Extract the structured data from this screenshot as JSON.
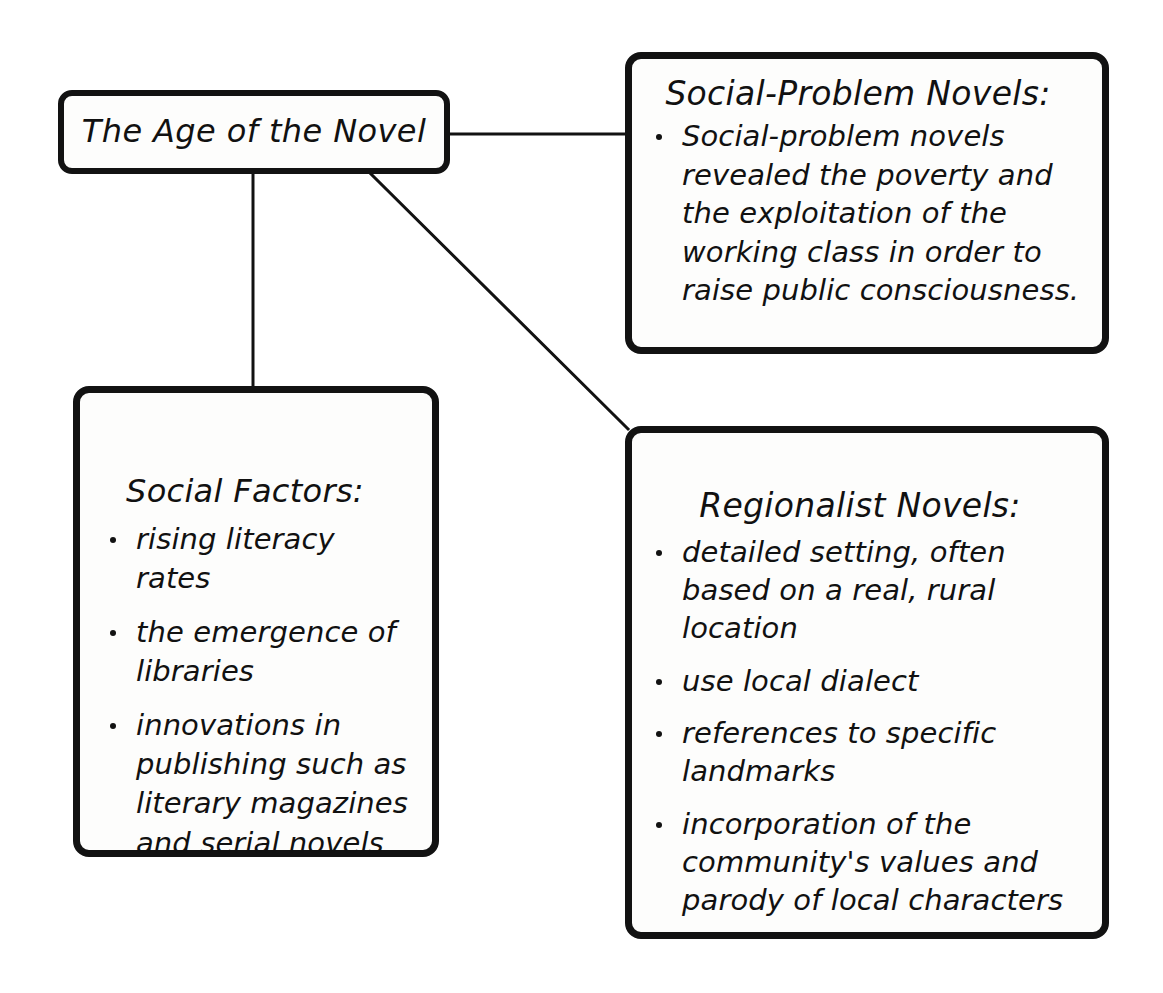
{
  "diagram": {
    "root": {
      "title": "The Age of the Novel"
    },
    "nodes": {
      "social_problem": {
        "heading": "Social-Problem Novels:",
        "bullets": [
          "Social-problem novels revealed the poverty and the exploitation of the working class in order to raise public consciousness."
        ]
      },
      "social_factors": {
        "heading": "Social Factors:",
        "bullets": [
          "rising literacy rates",
          "the emergence of libraries",
          "innovations in publishing such as literary magazines and serial novels"
        ]
      },
      "regionalist": {
        "heading": "Regionalist Novels:",
        "bullets": [
          "detailed setting, often based on a real, rural location",
          "use local dialect",
          "references to specific landmarks",
          "incorporation of the community's values and parody of local characters"
        ]
      }
    },
    "colors": {
      "background": "#ffffff",
      "box_fill": "#fdfdfc",
      "ink": "#121212"
    }
  }
}
